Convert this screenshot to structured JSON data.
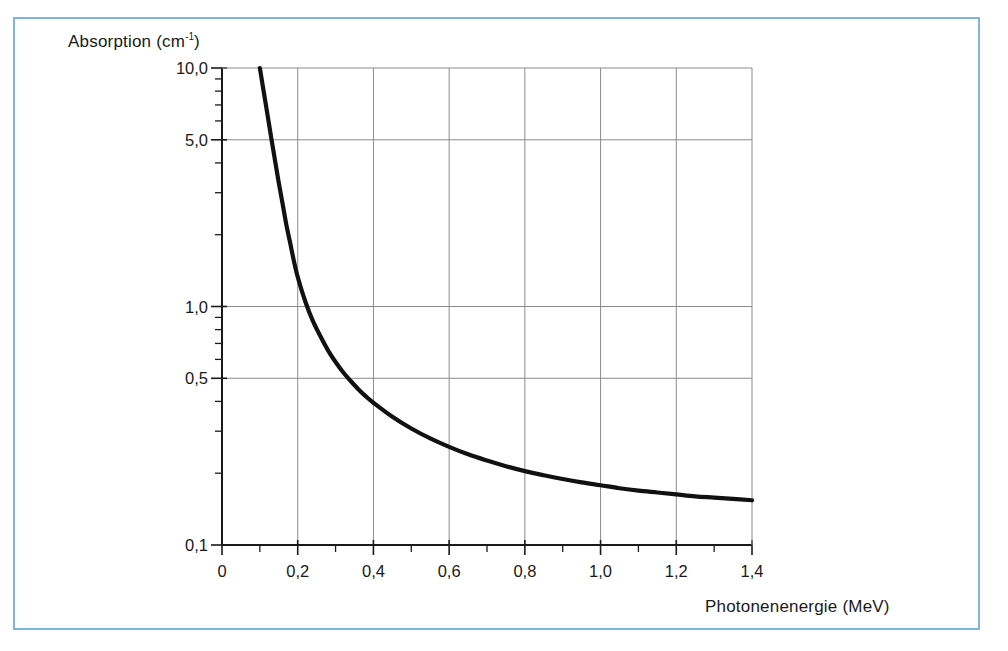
{
  "figure": {
    "frame_color": "#7db6db",
    "background": "#ffffff",
    "curve_color": "#111111",
    "grid_color": "#8c8c8c",
    "axis_color": "#1a1a1a"
  },
  "chart_data": {
    "type": "line",
    "title": "",
    "subtitle": "",
    "xlabel": "Photonenenergie (MeV)",
    "ylabel": "Absorption (cm",
    "ylabel_superscript": "-1",
    "ylabel_suffix": ")",
    "xlabel_plain": "Photonenenergie (MeV)",
    "ylabel_plain": "Absorption (cm-1)",
    "xscale": "linear",
    "yscale": "log",
    "xlim": [
      0,
      1.4
    ],
    "ylim": [
      0.1,
      10
    ],
    "grid": true,
    "legend": "none",
    "x_ticks": [
      "0",
      "0,2",
      "0,4",
      "0,6",
      "0,8",
      "1,0",
      "1,2",
      "1,4"
    ],
    "x_tick_values": [
      0,
      0.2,
      0.4,
      0.6,
      0.8,
      1.0,
      1.2,
      1.4
    ],
    "x_minor_tick_values": [
      0.1,
      0.3,
      0.5,
      0.7,
      0.9,
      1.1,
      1.3
    ],
    "y_ticks": [
      "10,0",
      "5,0",
      "1,0",
      "0,5",
      "0,1"
    ],
    "y_tick_values": [
      10,
      5,
      1,
      0.5,
      0.1
    ],
    "y_gridline_values": [
      5,
      1,
      0.5
    ],
    "y_minor_tick_values": [
      9,
      8,
      7,
      6,
      4,
      3,
      2,
      0.9,
      0.8,
      0.7,
      0.6,
      0.4,
      0.3,
      0.2
    ],
    "series": [
      {
        "name": "Absorption",
        "x": [
          0.1,
          0.11,
          0.12,
          0.13,
          0.14,
          0.15,
          0.16,
          0.17,
          0.18,
          0.19,
          0.2,
          0.22,
          0.24,
          0.26,
          0.28,
          0.3,
          0.32,
          0.34,
          0.36,
          0.38,
          0.4,
          0.45,
          0.5,
          0.55,
          0.6,
          0.65,
          0.7,
          0.75,
          0.8,
          0.85,
          0.9,
          0.95,
          1.0,
          1.05,
          1.1,
          1.15,
          1.2,
          1.25,
          1.3,
          1.35,
          1.4
        ],
        "y": [
          10.0,
          8.0,
          6.4,
          5.1,
          4.1,
          3.3,
          2.7,
          2.2,
          1.85,
          1.55,
          1.33,
          1.05,
          0.87,
          0.75,
          0.655,
          0.585,
          0.53,
          0.487,
          0.45,
          0.42,
          0.395,
          0.345,
          0.308,
          0.28,
          0.258,
          0.24,
          0.226,
          0.214,
          0.204,
          0.196,
          0.189,
          0.183,
          0.178,
          0.173,
          0.169,
          0.166,
          0.163,
          0.16,
          0.158,
          0.156,
          0.154
        ]
      }
    ]
  }
}
